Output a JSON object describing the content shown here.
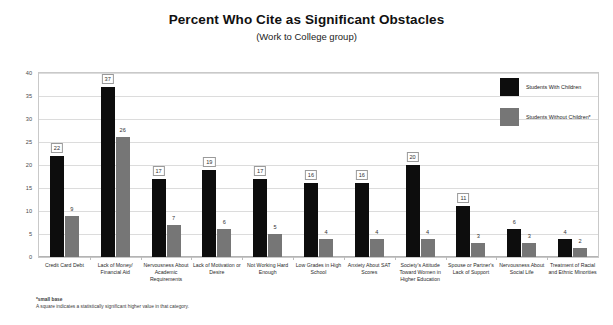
{
  "chart_data": {
    "type": "bar",
    "title": "Percent Who Cite as Significant Obstacles",
    "subtitle": "(Work to College group)",
    "xlabel": "",
    "ylabel": "",
    "ylim": [
      0,
      40
    ],
    "yticks": [
      0,
      5,
      10,
      15,
      20,
      25,
      30,
      35,
      40
    ],
    "grid": true,
    "legend_position": "top-right",
    "categories": [
      "Credit Card Debt",
      "Lack of Money/ Financial Aid",
      "Nervousness About Academic Requirements",
      "Lack of Motivation or Desire",
      "Not Working Hard Enough",
      "Low Grades in High School",
      "Anxiety About SAT Scores",
      "Society's Attitude Toward Women in Higher Education",
      "Spouse or Partner's Lack of Support",
      "Nervousness About Social Life",
      "Treatment of Racial and Ethnic Minorities"
    ],
    "series": [
      {
        "name": "Students With Children",
        "color": "#0d0d0d",
        "values": [
          22,
          37,
          17,
          19,
          17,
          16,
          16,
          20,
          11,
          6,
          4
        ],
        "significant": [
          true,
          true,
          true,
          true,
          true,
          true,
          true,
          true,
          true,
          false,
          false
        ]
      },
      {
        "name": "Students Without Children*",
        "color": "#767676",
        "values": [
          9,
          26,
          7,
          6,
          5,
          4,
          4,
          4,
          3,
          3,
          2
        ],
        "significant": [
          false,
          false,
          false,
          false,
          false,
          false,
          false,
          false,
          false,
          false,
          false
        ]
      }
    ],
    "annotations": [
      "*small base",
      "A square indicates a statistically significant higher value in that category."
    ]
  },
  "footnotes": {
    "small_base": "*small base",
    "square_note": "A square indicates a statistically significant higher value in that category."
  }
}
